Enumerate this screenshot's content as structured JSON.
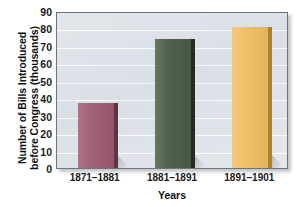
{
  "chart_data": {
    "type": "bar",
    "title": "",
    "xlabel": "Years",
    "ylabel_line1": "Number of Bills Introduced",
    "ylabel_line2": "before Congress (thousands)",
    "categories": [
      "1871–1881",
      "1881–1891",
      "1891–1901"
    ],
    "values": [
      37,
      74,
      81
    ],
    "series": [
      {
        "name": "Bills introduced before Congress",
        "values": [
          37,
          74,
          81
        ]
      }
    ],
    "ylim": [
      0,
      90
    ],
    "yticks": [
      0,
      10,
      20,
      30,
      40,
      50,
      60,
      70,
      80,
      90
    ],
    "ytick_labels": [
      "0",
      "10",
      "20",
      "30",
      "40",
      "50",
      "60",
      "70",
      "80",
      "90"
    ],
    "grid": true,
    "grid_axis": "y",
    "legend": false,
    "legend_position": "none",
    "bar_colors": [
      "#9d5b72",
      "#4a5c45",
      "#f0bf63"
    ],
    "bar_edge_colors": [
      "#5e3343",
      "#232c20",
      "#b07f2a"
    ],
    "plot_background": "#dfe4ea",
    "gridline_color": "#ffffff",
    "frame_color": "#6f737a",
    "text_color": "#111111"
  }
}
